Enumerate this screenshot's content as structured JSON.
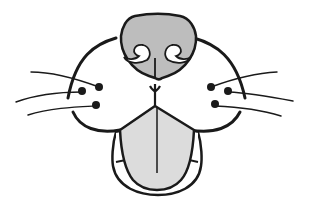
{
  "illustration": {
    "subject": "cat muzzle line drawing",
    "colors": {
      "background": "#ffffff",
      "line": "#1a1a1a",
      "nose_fill": "#bdbdbd",
      "tongue_fill": "#dcdcdc"
    },
    "parts": [
      "nose",
      "nostrils",
      "whisker-pads",
      "whiskers",
      "philtrum",
      "tongue",
      "lower-jaw"
    ]
  }
}
